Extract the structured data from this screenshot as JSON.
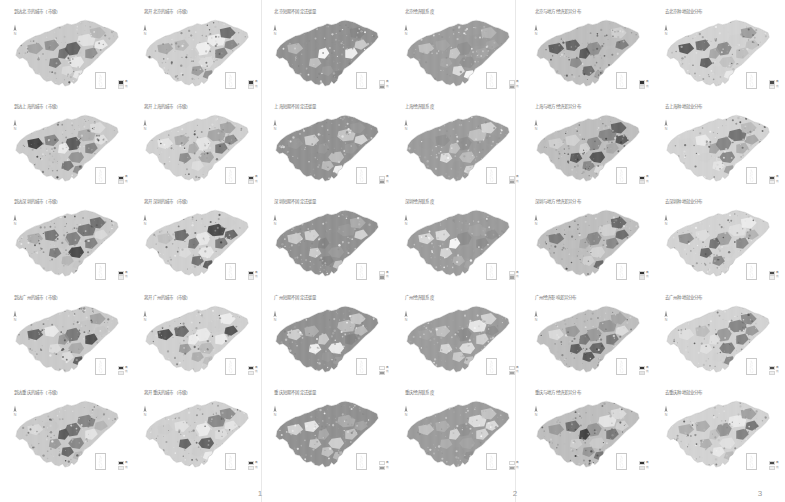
{
  "figure": {
    "type": "map-grid-atlas",
    "rows": 5,
    "columns": 6,
    "page_columns": 3,
    "region": "China"
  },
  "pages": [
    {
      "number": "1"
    },
    {
      "number": "2"
    },
    {
      "number": "3"
    }
  ],
  "cities": [
    {
      "name": "北京",
      "pinyin": "Beijing"
    },
    {
      "name": "上海",
      "pinyin": "Shanghai"
    },
    {
      "name": "深圳",
      "pinyin": "Shenzhen"
    },
    {
      "name": "广州",
      "pinyin": "Guangzhou"
    },
    {
      "name": "重庆",
      "pinyin": "Chongqing"
    }
  ],
  "column_themes": [
    "到达城市（市级）",
    "离开城市（市级）",
    "短期不固定迁徙量",
    "经济联系度",
    "与地方经济差异分布",
    "去城市农民工分布"
  ],
  "legend": {
    "label_high": "高",
    "label_low": "低",
    "swatch_count": 2
  },
  "icons": {
    "north_arrow": "north-arrow-icon",
    "inset": "south-china-sea-inset-icon",
    "legend": "map-legend-icon"
  },
  "tiles": [
    {
      "id": "r1c1",
      "title": "到达北京的城市（市级）",
      "city": "北京",
      "theme": "到达城市（市级）",
      "family": "fam-a",
      "page": "1"
    },
    {
      "id": "r1c2",
      "title": "离开北京的城市（市级）",
      "city": "北京",
      "theme": "离开城市（市级）",
      "family": "fam-b",
      "page": "1"
    },
    {
      "id": "r1c3",
      "title": "北京短期不固定迁徙量",
      "city": "北京",
      "theme": "短期不固定迁徙量",
      "family": "fam-c",
      "page": "2"
    },
    {
      "id": "r1c4",
      "title": "北京经济联系度",
      "city": "北京",
      "theme": "经济联系度",
      "family": "fam-d",
      "page": "2"
    },
    {
      "id": "r1c5",
      "title": "北京与地方经济差异分布",
      "city": "北京",
      "theme": "与地方经济差异分布",
      "family": "fam-e",
      "page": "3"
    },
    {
      "id": "r1c6",
      "title": "去北京种地就业分布",
      "city": "北京",
      "theme": "去城市农民工分布",
      "family": "fam-f",
      "page": "3"
    },
    {
      "id": "r2c1",
      "title": "到达上海的城市（市级）",
      "city": "上海",
      "theme": "到达城市（市级）",
      "family": "fam-a",
      "page": "1"
    },
    {
      "id": "r2c2",
      "title": "离开上海的城市（市级）",
      "city": "上海",
      "theme": "离开城市（市级）",
      "family": "fam-b",
      "page": "1"
    },
    {
      "id": "r2c3",
      "title": "上海短期不固定迁徙量",
      "city": "上海",
      "theme": "短期不固定迁徙量",
      "family": "fam-c",
      "page": "2"
    },
    {
      "id": "r2c4",
      "title": "上海经济联系度",
      "city": "上海",
      "theme": "经济联系度",
      "family": "fam-d",
      "page": "2"
    },
    {
      "id": "r2c5",
      "title": "上海与地方经济差异分布",
      "city": "上海",
      "theme": "与地方经济差异分布",
      "family": "fam-e",
      "page": "3"
    },
    {
      "id": "r2c6",
      "title": "去上海种地就业分布",
      "city": "上海",
      "theme": "去城市农民工分布",
      "family": "fam-f",
      "page": "3"
    },
    {
      "id": "r3c1",
      "title": "到达深圳的城市（市级）",
      "city": "深圳",
      "theme": "到达城市（市级）",
      "family": "fam-a",
      "page": "1"
    },
    {
      "id": "r3c2",
      "title": "离开深圳的城市（市级）",
      "city": "深圳",
      "theme": "离开城市（市级）",
      "family": "fam-b",
      "page": "1"
    },
    {
      "id": "r3c3",
      "title": "深圳短期不固定迁徙量",
      "city": "深圳",
      "theme": "短期不固定迁徙量",
      "family": "fam-c",
      "page": "2"
    },
    {
      "id": "r3c4",
      "title": "深圳经济联系度",
      "city": "深圳",
      "theme": "经济联系度",
      "family": "fam-d",
      "page": "2"
    },
    {
      "id": "r3c5",
      "title": "深圳与地方经济差异分布",
      "city": "深圳",
      "theme": "与地方经济差异分布",
      "family": "fam-e",
      "page": "3"
    },
    {
      "id": "r3c6",
      "title": "去深圳种地就业分布",
      "city": "深圳",
      "theme": "去城市农民工分布",
      "family": "fam-f",
      "page": "3"
    },
    {
      "id": "r4c1",
      "title": "到达广州的城市（市级）",
      "city": "广州",
      "theme": "到达城市（市级）",
      "family": "fam-a",
      "page": "1"
    },
    {
      "id": "r4c2",
      "title": "离开广州的城市（市级）",
      "city": "广州",
      "theme": "离开城市（市级）",
      "family": "fam-b",
      "page": "1"
    },
    {
      "id": "r4c3",
      "title": "广州短期不固定迁徙量",
      "city": "广州",
      "theme": "短期不固定迁徙量",
      "family": "fam-c",
      "page": "2"
    },
    {
      "id": "r4c4",
      "title": "广州经济联系度",
      "city": "广州",
      "theme": "经济联系度",
      "family": "fam-d",
      "page": "2"
    },
    {
      "id": "r4c5",
      "title": "广州经济影响差异分布",
      "city": "广州",
      "theme": "与地方经济差异分布",
      "family": "fam-e",
      "page": "3"
    },
    {
      "id": "r4c6",
      "title": "去广州种地就业分布",
      "city": "广州",
      "theme": "去城市农民工分布",
      "family": "fam-f",
      "page": "3"
    },
    {
      "id": "r5c1",
      "title": "到达重庆的城市（市级）",
      "city": "重庆",
      "theme": "到达城市（市级）",
      "family": "fam-a",
      "page": "1"
    },
    {
      "id": "r5c2",
      "title": "离开重庆的城市（市级）",
      "city": "重庆",
      "theme": "离开城市（市级）",
      "family": "fam-b",
      "page": "1"
    },
    {
      "id": "r5c3",
      "title": "重庆短期不固定迁徙量",
      "city": "重庆",
      "theme": "短期不固定迁徙量",
      "family": "fam-c",
      "page": "2"
    },
    {
      "id": "r5c4",
      "title": "重庆经济联系度",
      "city": "重庆",
      "theme": "经济联系度",
      "family": "fam-d",
      "page": "2"
    },
    {
      "id": "r5c5",
      "title": "重庆与地方经济差异分布",
      "city": "重庆",
      "theme": "与地方经济差异分布",
      "family": "fam-e",
      "page": "3"
    },
    {
      "id": "r5c6",
      "title": "去重庆种地就业分布",
      "city": "重庆",
      "theme": "去城市农民工分布",
      "family": "fam-f",
      "page": "3"
    }
  ]
}
